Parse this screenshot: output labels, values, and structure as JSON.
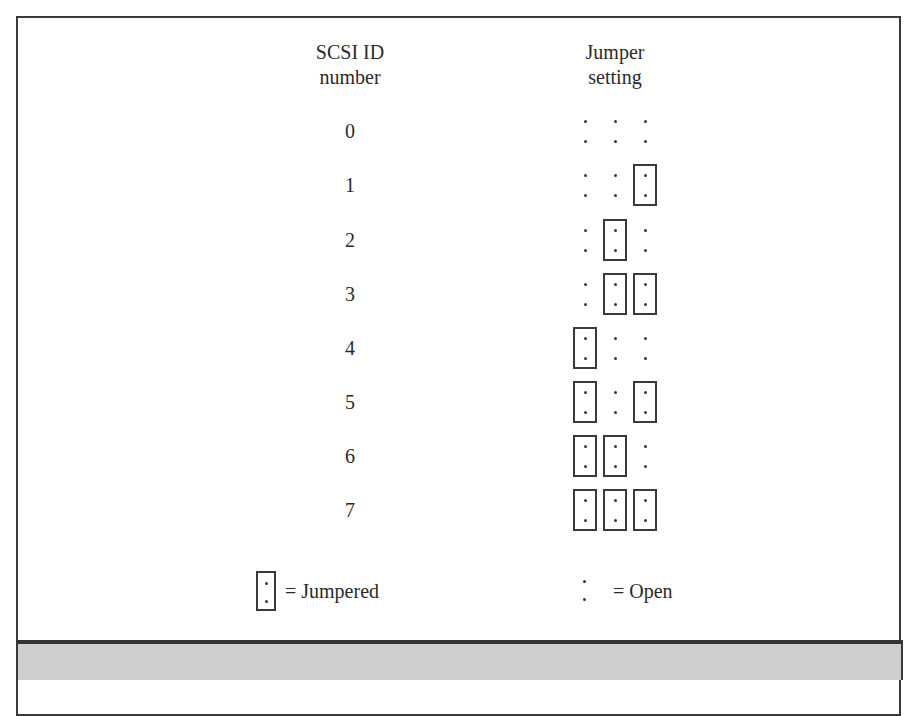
{
  "figure": {
    "headers": {
      "id_line1": "SCSI ID",
      "id_line2": "number",
      "jumper_line1": "Jumper",
      "jumper_line2": "setting"
    },
    "rows": [
      {
        "id": "0",
        "pins": [
          false,
          false,
          false
        ]
      },
      {
        "id": "1",
        "pins": [
          false,
          false,
          true
        ]
      },
      {
        "id": "2",
        "pins": [
          false,
          true,
          false
        ]
      },
      {
        "id": "3",
        "pins": [
          false,
          true,
          true
        ]
      },
      {
        "id": "4",
        "pins": [
          true,
          false,
          false
        ]
      },
      {
        "id": "5",
        "pins": [
          true,
          false,
          true
        ]
      },
      {
        "id": "6",
        "pins": [
          true,
          true,
          false
        ]
      },
      {
        "id": "7",
        "pins": [
          true,
          true,
          true
        ]
      }
    ],
    "legend": {
      "jumpered_label": "= Jumpered",
      "open_label": "= Open"
    },
    "colors": {
      "line": "#3a3a3a",
      "caption_bar": "#cfcfcf",
      "background": "#ffffff"
    }
  }
}
